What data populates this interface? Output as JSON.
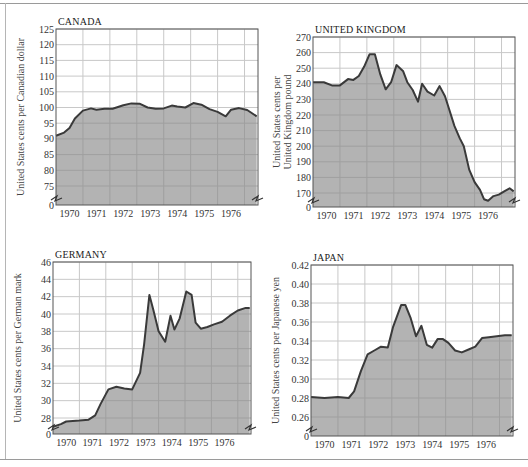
{
  "figure": {
    "x_tick_labels": [
      "1970",
      "1971",
      "1972",
      "1973",
      "1974",
      "1975",
      "1976"
    ],
    "colors": {
      "fill": "#b3b3b3",
      "line": "#3a3a3a",
      "grid": "#c8c8c8",
      "grid_on_fill": "#8f8f8f",
      "frame": "#555555"
    }
  },
  "chart_data": [
    {
      "type": "area",
      "title": "CANADA",
      "ylabel": "United States cents per Canadian dollar",
      "xlabel": "",
      "x_categories": [
        "1970",
        "1971",
        "1972",
        "1973",
        "1974",
        "1975",
        "1976"
      ],
      "yticks": [
        "0",
        "75",
        "80",
        "85",
        "90",
        "95",
        "100",
        "105",
        "110",
        "115",
        "120",
        "125"
      ],
      "ylim": [
        75,
        125
      ],
      "axis_break": true,
      "grid": true,
      "x": [
        1969.5,
        1969.8,
        1970.0,
        1970.2,
        1970.5,
        1970.8,
        1971.0,
        1971.3,
        1971.6,
        1972.0,
        1972.3,
        1972.6,
        1972.9,
        1973.2,
        1973.5,
        1973.8,
        1974.0,
        1974.3,
        1974.6,
        1974.9,
        1975.2,
        1975.5,
        1975.8,
        1976.0,
        1976.3,
        1976.6,
        1976.95
      ],
      "values": [
        91,
        92,
        93.5,
        96.5,
        99,
        99.7,
        99.3,
        99.6,
        99.6,
        100.7,
        101.3,
        101.2,
        100,
        99.6,
        99.7,
        100.6,
        100.3,
        100,
        101.4,
        100.9,
        99.5,
        98.6,
        97.2,
        99.3,
        99.8,
        99.2,
        97.2
      ],
      "plot_px": {
        "left": 56,
        "right": 258,
        "top": 29,
        "bottom": 205,
        "ymin_px": 186,
        "ymax_px": 29
      }
    },
    {
      "type": "area",
      "title": "UNITED KINGDOM",
      "ylabel": "United States cents per United Kingdom pound",
      "xlabel": "",
      "x_categories": [
        "1970",
        "1971",
        "1972",
        "1973",
        "1974",
        "1975",
        "1976"
      ],
      "yticks": [
        "0",
        "170",
        "180",
        "190",
        "200",
        "210",
        "220",
        "230",
        "240",
        "250",
        "260",
        "270"
      ],
      "ylim": [
        170,
        270
      ],
      "axis_break": true,
      "grid": true,
      "x": [
        1969.5,
        1969.9,
        1970.2,
        1970.5,
        1970.8,
        1971.0,
        1971.2,
        1971.4,
        1971.6,
        1971.8,
        1972.0,
        1972.2,
        1972.4,
        1972.6,
        1972.85,
        1973.0,
        1973.2,
        1973.4,
        1973.55,
        1973.75,
        1974.0,
        1974.2,
        1974.4,
        1974.55,
        1974.75,
        1974.95,
        1975.1,
        1975.3,
        1975.5,
        1975.7,
        1975.85,
        1976.0,
        1976.2,
        1976.4,
        1976.6,
        1976.8,
        1976.95
      ],
      "values": [
        241,
        241,
        239,
        239,
        243,
        242.5,
        245,
        251,
        259,
        259,
        246,
        236.5,
        241,
        252,
        248,
        241,
        236,
        228.5,
        240,
        235,
        232.5,
        238.5,
        232,
        224,
        213,
        205,
        200,
        185,
        177,
        172,
        166,
        165,
        168,
        169,
        171,
        173,
        171
      ],
      "plot_px": {
        "left": 313,
        "right": 515,
        "top": 37,
        "bottom": 207,
        "ymin_px": 193,
        "ymax_px": 37
      }
    },
    {
      "type": "area",
      "title": "GERMANY",
      "ylabel": "United States cents per German mark",
      "xlabel": "",
      "x_categories": [
        "1970",
        "1971",
        "1972",
        "1973",
        "1974",
        "1975",
        "1976"
      ],
      "yticks": [
        "0",
        "28",
        "30",
        "32",
        "34",
        "36",
        "38",
        "40",
        "42",
        "44",
        "46"
      ],
      "ylim": [
        28,
        46
      ],
      "axis_break": true,
      "grid": true,
      "x": [
        1969.5,
        1969.8,
        1970.0,
        1970.5,
        1970.85,
        1971.1,
        1971.3,
        1971.6,
        1971.9,
        1972.2,
        1972.5,
        1972.8,
        1972.95,
        1973.15,
        1973.3,
        1973.5,
        1973.75,
        1973.95,
        1974.1,
        1974.3,
        1974.55,
        1974.75,
        1974.9,
        1975.1,
        1975.35,
        1975.6,
        1975.9,
        1976.2,
        1976.5,
        1976.8,
        1976.95
      ],
      "values": [
        27,
        27.3,
        27.6,
        27.7,
        27.8,
        28.3,
        29.6,
        31.3,
        31.6,
        31.4,
        31.3,
        33.2,
        36.5,
        42.2,
        40.5,
        38,
        36.8,
        39.8,
        38.2,
        39.5,
        42.6,
        42.2,
        39,
        38.3,
        38.5,
        38.8,
        39.1,
        39.8,
        40.4,
        40.7,
        40.7
      ],
      "plot_px": {
        "left": 53,
        "right": 251,
        "top": 262,
        "bottom": 434,
        "ymin_px": 418,
        "ymax_px": 262
      }
    },
    {
      "type": "area",
      "title": "JAPAN",
      "ylabel": "United States cents per Japanese yen",
      "xlabel": "",
      "x_categories": [
        "1970",
        "1971",
        "1972",
        "1973",
        "1974",
        "1975",
        "1976"
      ],
      "yticks": [
        "0",
        "0.26",
        "0.28",
        "0.30",
        "0.32",
        "0.34",
        "0.36",
        "0.38",
        "0.40",
        "0.42"
      ],
      "ylim": [
        0.26,
        0.42
      ],
      "axis_break": true,
      "grid": true,
      "x": [
        1969.5,
        1970.0,
        1970.5,
        1970.9,
        1971.1,
        1971.35,
        1971.6,
        1971.85,
        1972.1,
        1972.35,
        1972.55,
        1972.85,
        1973.0,
        1973.2,
        1973.4,
        1973.6,
        1973.8,
        1974.0,
        1974.2,
        1974.4,
        1974.6,
        1974.85,
        1975.1,
        1975.35,
        1975.6,
        1975.85,
        1976.1,
        1976.4,
        1976.7,
        1976.95
      ],
      "values": [
        0.281,
        0.28,
        0.281,
        0.28,
        0.287,
        0.308,
        0.326,
        0.33,
        0.334,
        0.333,
        0.355,
        0.378,
        0.378,
        0.364,
        0.345,
        0.356,
        0.336,
        0.333,
        0.342,
        0.342,
        0.338,
        0.33,
        0.328,
        0.331,
        0.334,
        0.343,
        0.344,
        0.345,
        0.346,
        0.346
      ],
      "plot_px": {
        "left": 311,
        "right": 513,
        "top": 265,
        "bottom": 436,
        "ymin_px": 417,
        "ymax_px": 265
      }
    }
  ]
}
